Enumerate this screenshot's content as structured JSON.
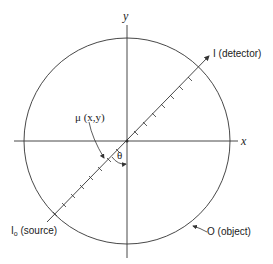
{
  "diagram": {
    "axes": {
      "x_label": "x",
      "y_label": "y"
    },
    "labels": {
      "detector": "I (detector)",
      "source_main": "I",
      "source_sub": "o",
      "source_rest": " (source)",
      "object": "O (object)",
      "mu": "μ (x,y)",
      "theta": "θ"
    },
    "colors": {
      "line": "#333333",
      "background": "#ffffff"
    }
  }
}
